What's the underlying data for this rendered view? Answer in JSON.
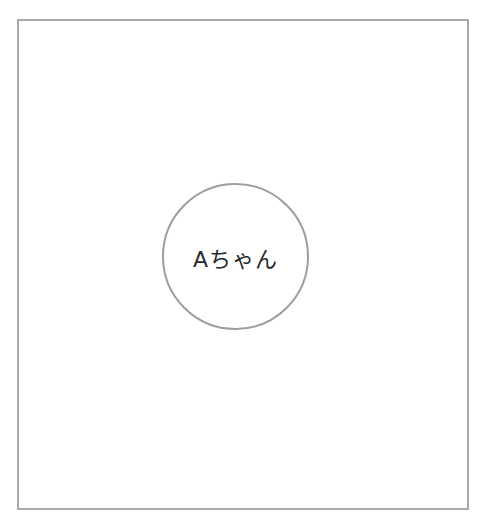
{
  "diagram": {
    "frame": {
      "border_color": "#a9a9a9",
      "background": "#ffffff"
    },
    "nodes": [
      {
        "shape": "circle",
        "label": "Aちゃん",
        "border_color": "#9e9e9e",
        "text_color": "#2a2a2a"
      }
    ],
    "edges": []
  }
}
